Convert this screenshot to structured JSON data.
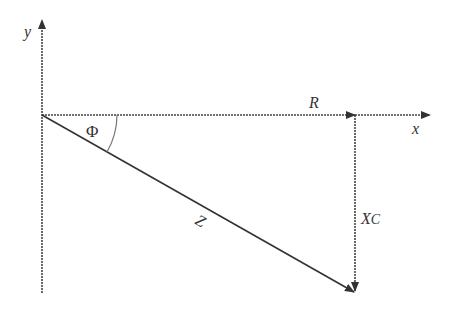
{
  "diagram": {
    "type": "impedance-triangle",
    "axes": {
      "x_label": "x",
      "y_label": "y"
    },
    "vectors": {
      "resistance_label": "R",
      "reactance_label": "X",
      "reactance_subscript": "C",
      "impedance_label": "Z"
    },
    "angle_label": "Φ",
    "colors": {
      "line": "#333333",
      "arc": "#777777",
      "background": "#ffffff"
    }
  }
}
